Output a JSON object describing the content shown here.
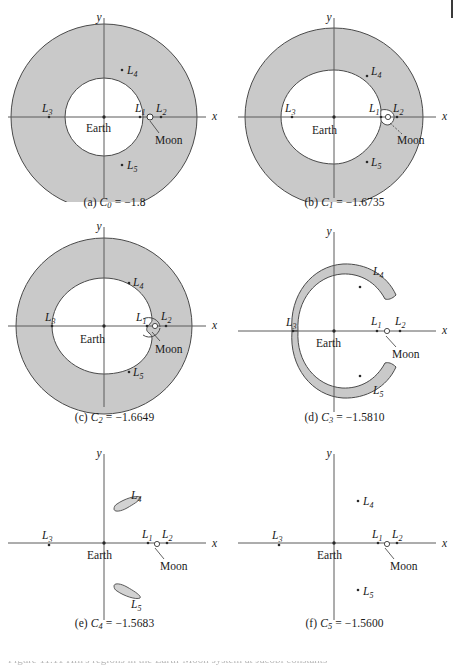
{
  "figure": {
    "panel_count": 6,
    "shade_color": "#c9c9c9",
    "stroke_color": "#3a3a3a",
    "axis_color": "#5a5a5a",
    "background": "#ffffff",
    "truncated_footer_text": "Figure 11.11 Hill's regions in the Earth-Moon system at Jacobi constants",
    "panels": [
      {
        "id": "a",
        "caption_prefix": "(a)",
        "caption_symbol": "C",
        "caption_subscript": "0",
        "caption_equals": "=",
        "caption_value": "−1.8",
        "caption_full": "(a) C0 = −1.8",
        "region_type": "full-annulus",
        "inner_radius": 39,
        "outer_radius": 93,
        "moon_lobe": "none",
        "axis_x_label": "x",
        "axis_y_label": "y",
        "body_label": "Earth",
        "moon_label": "Moon",
        "lagrange_points": [
          "L1",
          "L2",
          "L3",
          "L4",
          "L5"
        ]
      },
      {
        "id": "b",
        "caption_prefix": "(b)",
        "caption_symbol": "C",
        "caption_subscript": "1",
        "caption_equals": "=",
        "caption_value": "−1.6735",
        "caption_full": "(b) C1 = −1.6735",
        "region_type": "annulus-with-moon-lobe",
        "inner_radius": 47,
        "outer_radius": 89,
        "moon_lobe": "closed-small",
        "axis_x_label": "x",
        "axis_y_label": "y",
        "body_label": "Earth",
        "moon_label": "Moon",
        "lagrange_points": [
          "L1",
          "L2",
          "L3",
          "L4",
          "L5"
        ]
      },
      {
        "id": "c",
        "caption_prefix": "(c)",
        "caption_symbol": "C",
        "caption_subscript": "2",
        "caption_equals": "=",
        "caption_value": "−1.6649",
        "caption_full": "(c) C2 = −1.6649",
        "region_type": "annulus-open-at-L2",
        "inner_radius": 48,
        "outer_radius": 88,
        "moon_lobe": "open-neck",
        "axis_x_label": "x",
        "axis_y_label": "y",
        "body_label": "Earth",
        "moon_label": "Moon",
        "lagrange_points": [
          "L1",
          "L2",
          "L3",
          "L4",
          "L5"
        ]
      },
      {
        "id": "d",
        "caption_prefix": "(d)",
        "caption_symbol": "C",
        "caption_subscript": "3",
        "caption_equals": "=",
        "caption_value": "−1.5810",
        "caption_full": "(d) C3 = −1.5810",
        "region_type": "two-crescents",
        "inner_radius": 62,
        "outer_radius": 70,
        "moon_lobe": "none",
        "axis_x_label": "x",
        "axis_y_label": "y",
        "body_label": "Earth",
        "moon_label": "Moon",
        "lagrange_points": [
          "L1",
          "L2",
          "L3",
          "L4",
          "L5"
        ]
      },
      {
        "id": "e",
        "caption_prefix": "(e)",
        "caption_symbol": "C",
        "caption_subscript": "4",
        "caption_equals": "=",
        "caption_value": "−1.5683",
        "caption_full": "(e) C4 = −1.5683",
        "region_type": "two-slivers",
        "moon_lobe": "none",
        "axis_x_label": "x",
        "axis_y_label": "y",
        "body_label": "Earth",
        "moon_label": "Moon",
        "lagrange_points": [
          "L1",
          "L2",
          "L3",
          "L4",
          "L5"
        ]
      },
      {
        "id": "f",
        "caption_prefix": "(f)",
        "caption_symbol": "C",
        "caption_subscript": "5",
        "caption_equals": "=",
        "caption_value": "−1.5600",
        "caption_full": "(f) C5 = −1.5600",
        "region_type": "points-only",
        "moon_lobe": "none",
        "axis_x_label": "x",
        "axis_y_label": "y",
        "body_label": "Earth",
        "moon_label": "Moon",
        "lagrange_points": [
          "L1",
          "L2",
          "L3",
          "L4",
          "L5"
        ]
      }
    ],
    "labels": {
      "L1": "L",
      "L2": "L",
      "L3": "L",
      "L4": "L",
      "L5": "L",
      "L1_sub": "1",
      "L2_sub": "2",
      "L3_sub": "3",
      "L4_sub": "4",
      "L5_sub": "5",
      "earth": "Earth",
      "moon": "Moon",
      "axis_x": "x",
      "axis_y": "y"
    }
  }
}
